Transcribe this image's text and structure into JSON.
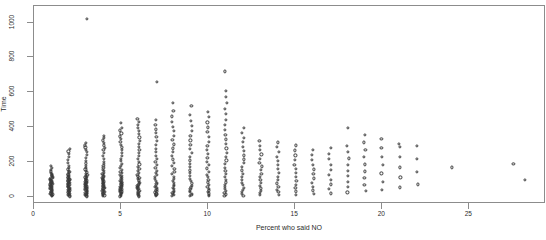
{
  "chart_data": {
    "type": "scatter",
    "title": "",
    "xlabel": "Percent who said NO",
    "ylabel": "Time",
    "xlim": [
      0,
      29.4
    ],
    "ylim": [
      -40,
      1095
    ],
    "grid": false,
    "legend": null,
    "marker": "open-circle",
    "xticks": [
      0,
      5,
      10,
      15,
      20,
      25
    ],
    "xticklabels": [
      "0",
      "5",
      "10",
      "15",
      "20",
      "25"
    ],
    "yticks": [
      0,
      200,
      400,
      600,
      800,
      1000
    ],
    "yticklabels": [
      "0",
      "200",
      "400",
      "600",
      "800",
      "1000"
    ],
    "series": [
      {
        "name": "observations",
        "columns": [
          {
            "x": 1,
            "y": [
              5,
              9,
              12,
              15,
              18,
              21,
              24,
              27,
              30,
              33,
              36,
              39,
              42,
              45,
              48,
              51,
              54,
              57,
              60,
              63,
              66,
              69,
              72,
              75,
              78,
              81,
              84,
              87,
              90,
              93,
              96,
              99,
              103,
              107,
              111,
              115,
              119,
              124,
              129,
              134,
              140,
              147,
              155,
              165,
              178
            ]
          },
          {
            "x": 2,
            "y": [
              4,
              8,
              11,
              14,
              17,
              20,
              23,
              26,
              29,
              32,
              35,
              38,
              41,
              44,
              47,
              50,
              53,
              56,
              59,
              62,
              65,
              68,
              71,
              74,
              77,
              80,
              83,
              86,
              89,
              92,
              95,
              98,
              101,
              104,
              108,
              112,
              116,
              120,
              125,
              130,
              136,
              142,
              150,
              158,
              168,
              180,
              196,
              212,
              228,
              245,
              262,
              278
            ]
          },
          {
            "x": 3,
            "y": [
              4,
              7,
              10,
              13,
              16,
              19,
              22,
              25,
              28,
              31,
              34,
              37,
              40,
              43,
              46,
              49,
              52,
              55,
              58,
              61,
              64,
              67,
              70,
              73,
              76,
              79,
              82,
              85,
              88,
              91,
              95,
              99,
              103,
              107,
              112,
              117,
              122,
              128,
              134,
              141,
              149,
              158,
              168,
              180,
              193,
              208,
              224,
              240,
              258,
              272,
              284,
              296,
              308,
              1020
            ]
          },
          {
            "x": 4,
            "y": [
              5,
              9,
              13,
              17,
              21,
              25,
              29,
              33,
              37,
              41,
              45,
              49,
              53,
              57,
              61,
              65,
              69,
              73,
              77,
              81,
              85,
              89,
              93,
              97,
              101,
              106,
              111,
              116,
              121,
              127,
              133,
              140,
              148,
              157,
              167,
              178,
              190,
              203,
              218,
              234,
              252,
              268,
              282,
              296,
              312,
              325,
              338,
              352
            ]
          },
          {
            "x": 5,
            "y": [
              4,
              8,
              12,
              16,
              20,
              24,
              28,
              32,
              36,
              40,
              44,
              48,
              52,
              56,
              60,
              64,
              68,
              72,
              76,
              80,
              84,
              88,
              92,
              97,
              102,
              108,
              114,
              121,
              128,
              136,
              145,
              155,
              166,
              178,
              191,
              205,
              220,
              236,
              252,
              268,
              284,
              300,
              316,
              332,
              348,
              365,
              382,
              398,
              424
            ]
          },
          {
            "x": 6,
            "y": [
              4,
              8,
              12,
              16,
              20,
              25,
              30,
              35,
              40,
              45,
              50,
              55,
              60,
              65,
              70,
              76,
              82,
              88,
              95,
              102,
              110,
              118,
              127,
              137,
              148,
              160,
              173,
              187,
              202,
              218,
              235,
              252,
              270,
              288,
              306,
              324,
              342,
              360,
              378,
              396,
              414,
              432,
              448
            ]
          },
          {
            "x": 7,
            "y": [
              5,
              10,
              15,
              20,
              26,
              32,
              38,
              44,
              51,
              58,
              66,
              74,
              83,
              92,
              102,
              113,
              125,
              138,
              152,
              167,
              183,
              200,
              218,
              237,
              257,
              278,
              300,
              322,
              344,
              366,
              388,
              412,
              440,
              660
            ]
          },
          {
            "x": 8,
            "y": [
              5,
              11,
              17,
              23,
              30,
              37,
              45,
              53,
              62,
              71,
              81,
              92,
              104,
              117,
              131,
              146,
              162,
              179,
              197,
              216,
              236,
              257,
              279,
              302,
              326,
              351,
              377,
              404,
              432,
              462,
              495,
              538
            ]
          },
          {
            "x": 9,
            "y": [
              6,
              13,
              20,
              28,
              36,
              45,
              55,
              66,
              78,
              91,
              105,
              120,
              136,
              153,
              171,
              190,
              210,
              231,
              253,
              276,
              300,
              325,
              351,
              378,
              406,
              435,
              470,
              520
            ]
          },
          {
            "x": 10,
            "y": [
              6,
              13,
              21,
              29,
              38,
              48,
              59,
              71,
              84,
              98,
              113,
              129,
              146,
              164,
              183,
              203,
              224,
              246,
              269,
              293,
              318,
              344,
              371,
              399,
              428,
              458,
              489
            ]
          },
          {
            "x": 11,
            "y": [
              7,
              15,
              24,
              34,
              45,
              57,
              70,
              84,
              99,
              115,
              132,
              150,
              169,
              189,
              210,
              232,
              255,
              279,
              304,
              330,
              357,
              385,
              414,
              444,
              475,
              507,
              540,
              574,
              610,
              720
            ]
          },
          {
            "x": 12,
            "y": [
              8,
              18,
              29,
              41,
              54,
              68,
              83,
              99,
              116,
              134,
              153,
              173,
              194,
              216,
              239,
              263,
              288,
              314,
              341,
              369,
              398
            ]
          },
          {
            "x": 13,
            "y": [
              10,
              22,
              35,
              49,
              64,
              80,
              97,
              115,
              134,
              154,
              175,
              197,
              220,
              244,
              269,
              295,
              322
            ]
          },
          {
            "x": 14,
            "y": [
              12,
              27,
              43,
              60,
              78,
              97,
              117,
              138,
              160,
              183,
              207,
              232,
              258,
              285,
              313
            ]
          },
          {
            "x": 15,
            "y": [
              14,
              32,
              51,
              71,
              92,
              114,
              137,
              161,
              186,
              212,
              239,
              267,
              296
            ]
          },
          {
            "x": 16,
            "y": [
              17,
              38,
              60,
              83,
              107,
              132,
              158,
              185,
              213,
              242,
              272
            ]
          },
          {
            "x": 17,
            "y": [
              21,
              46,
              72,
              99,
              127,
              156,
              186,
              217,
              249,
              282
            ]
          },
          {
            "x": 18,
            "y": [
              26,
              56,
              87,
              119,
              152,
              186,
              221,
              257,
              294,
              398
            ]
          },
          {
            "x": 19,
            "y": [
              33,
              70,
              108,
              147,
              187,
              228,
              270,
              313,
              356
            ]
          },
          {
            "x": 20,
            "y": [
              42,
              88,
              135,
              183,
              232,
              282,
              333
            ]
          },
          {
            "x": 21,
            "y": [
              55,
              112,
              170,
              229,
              289,
              304
            ]
          },
          {
            "x": 22,
            "y": [
              72,
              145,
              219,
              294
            ]
          },
          {
            "x": 24,
            "y": [
              170
            ]
          },
          {
            "x": 27.5,
            "y": [
              190
            ]
          },
          {
            "x": 28.2,
            "y": [
              100
            ]
          }
        ]
      }
    ]
  }
}
